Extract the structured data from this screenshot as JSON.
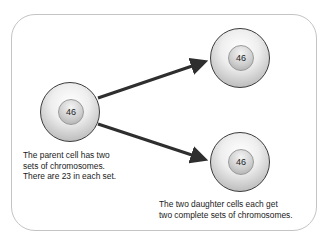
{
  "diagram": {
    "parent_cell": {
      "chromosome_count": "46"
    },
    "daughter_cells": [
      {
        "chromosome_count": "46"
      },
      {
        "chromosome_count": "46"
      }
    ],
    "captions": {
      "parent": [
        "The parent cell has two",
        "sets of chromosomes.",
        "There are 23 in each set."
      ],
      "daughters": [
        "The two daughter cells each get",
        "two complete sets of chromosomes."
      ]
    },
    "colors": {
      "arrow": "#2e2e2e",
      "frame": "#c4c4c4",
      "cell_outline": "#3c3c3c"
    }
  }
}
